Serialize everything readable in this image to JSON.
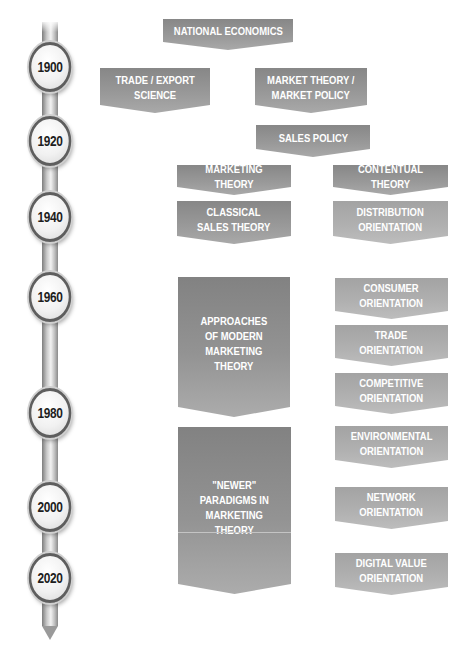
{
  "timeline": {
    "years": [
      "1900",
      "1920",
      "1940",
      "1960",
      "1980",
      "2000",
      "2020"
    ]
  },
  "boxes": {
    "national_economics": "NATIONAL ECONOMICS",
    "trade_export_science": "TRADE / EXPORT\nSCIENCE",
    "market_theory_policy": "MARKET THEORY /\nMARKET POLICY",
    "sales_policy": "SALES POLICY",
    "marketing_theory": "MARKETING THEORY",
    "contentual_theory": "CONTENTUAL THEORY",
    "classical_sales_theory": "CLASSICAL\nSALES THEORY",
    "distribution_orientation": "DISTRIBUTION\nORIENTATION",
    "approaches_modern": "APPROACHES\nOF MODERN\nMARKETING\nTHEORY",
    "consumer_orientation": "CONSUMER\nORIENTATION",
    "trade_orientation": "TRADE\nORIENTATION",
    "competitive_orientation": "COMPETITIVE\nORIENTATION",
    "newer_paradigms": "\"NEWER\"\nPARADIGMS IN\nMARKETING\nTHEORY",
    "environmental_orientation": "ENVIRONMENTAL\nORIENTATION",
    "network_orientation": "NETWORK\nORIENTATION",
    "digital_value_orientation": "DIGITAL VALUE\nORIENTATION"
  },
  "colors": {
    "box_dark": "#878787",
    "box_light": "#b1b1b1",
    "timeline_ring": "#5e5e5e",
    "year_text": "#1e1e1e"
  }
}
